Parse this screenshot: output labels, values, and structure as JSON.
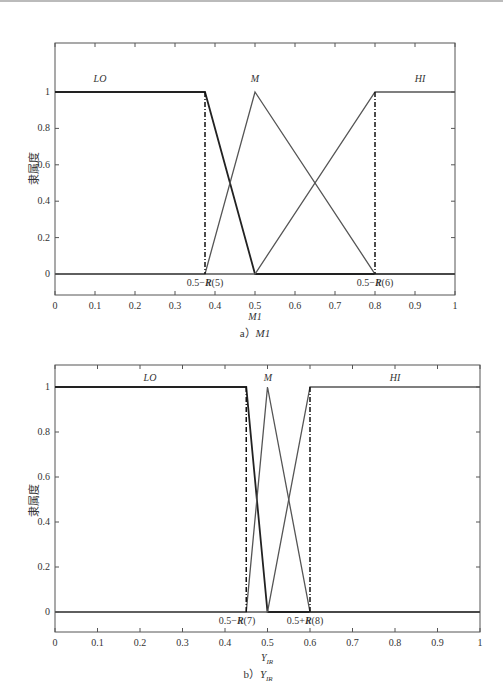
{
  "chart_data": [
    {
      "type": "line",
      "title": "",
      "caption": "a) M1",
      "caption_prefix": "a）",
      "caption_var": "M1",
      "xlabel": "M1",
      "ylabel": "隶属度",
      "xlim": [
        0,
        1
      ],
      "ylim": [
        -0.1,
        1.1
      ],
      "xticks": [
        "0",
        "0.1",
        "0.2",
        "0.3",
        "0.4",
        "0.5",
        "0.6",
        "0.7",
        "0.8",
        "0.9",
        "1"
      ],
      "yticks": [
        "0",
        "0.2",
        "0.4",
        "0.6",
        "0.8",
        "1"
      ],
      "grid": false,
      "series": [
        {
          "name": "LO",
          "x": [
            0,
            0.375,
            0.5,
            1
          ],
          "y": [
            1,
            1,
            0,
            0
          ]
        },
        {
          "name": "M",
          "x": [
            0,
            0.375,
            0.5,
            0.8,
            1
          ],
          "y": [
            0,
            0,
            1,
            0,
            0
          ]
        },
        {
          "name": "HI",
          "x": [
            0,
            0.5,
            0.8,
            1
          ],
          "y": [
            0,
            0,
            1,
            1
          ]
        }
      ],
      "annotations": [
        {
          "text": "0.5−R(5)",
          "x": 0.375,
          "style": "dash-dot vertical line"
        },
        {
          "text": "0.5−R(6)",
          "x": 0.8,
          "style": "dash-dot vertical line"
        }
      ]
    },
    {
      "type": "line",
      "title": "",
      "caption": "b) Y'IR",
      "caption_prefix": "b）",
      "caption_var": "Y'IR",
      "xlabel": "Y'IR",
      "ylabel": "隶属度",
      "xlim": [
        0,
        1
      ],
      "ylim": [
        -0.1,
        1.1
      ],
      "xticks": [
        "0",
        "0.1",
        "0.2",
        "0.3",
        "0.4",
        "0.5",
        "0.6",
        "0.7",
        "0.8",
        "0.9",
        "1"
      ],
      "yticks": [
        "0",
        "0.2",
        "0.4",
        "0.6",
        "0.8",
        "1"
      ],
      "grid": false,
      "series": [
        {
          "name": "LO",
          "x": [
            0,
            0.45,
            0.5,
            1
          ],
          "y": [
            1,
            1,
            0,
            0
          ]
        },
        {
          "name": "M",
          "x": [
            0,
            0.45,
            0.5,
            0.6,
            1
          ],
          "y": [
            0,
            0,
            1,
            0,
            0
          ]
        },
        {
          "name": "HI",
          "x": [
            0,
            0.5,
            0.6,
            1
          ],
          "y": [
            0,
            0,
            1,
            1
          ]
        }
      ],
      "annotations": [
        {
          "text": "0.5−R(7)",
          "x": 0.45,
          "style": "dash-dot vertical line"
        },
        {
          "text": "0.5+R(8)",
          "x": 0.6,
          "style": "dash-dot vertical line"
        }
      ]
    }
  ],
  "labels": {
    "ylabel": "隶属度",
    "chart1": {
      "lo": "LO",
      "m": "M",
      "hi": "HI",
      "ann1_prefix": "0.5−",
      "ann1_R": "R",
      "ann1_suffix": "(5)",
      "ann2_prefix": "0.5−",
      "ann2_R": "R",
      "ann2_suffix": "(6)",
      "xlabel": "M1",
      "caption_prefix": "a）",
      "caption_var": "M1"
    },
    "chart2": {
      "lo": "LO",
      "m": "M",
      "hi": "HI",
      "ann1_prefix": "0.5−",
      "ann1_R": "R",
      "ann1_suffix": "(7)",
      "ann2_prefix": "0.5+",
      "ann2_R": "R",
      "ann2_suffix": "(8)",
      "xlabel_main": "Y",
      "xlabel_sub": "IR",
      "xlabel_sup": "′",
      "caption_prefix": "b）",
      "caption_var_main": "Y",
      "caption_var_sub": "IR",
      "caption_var_sup": "′"
    }
  }
}
